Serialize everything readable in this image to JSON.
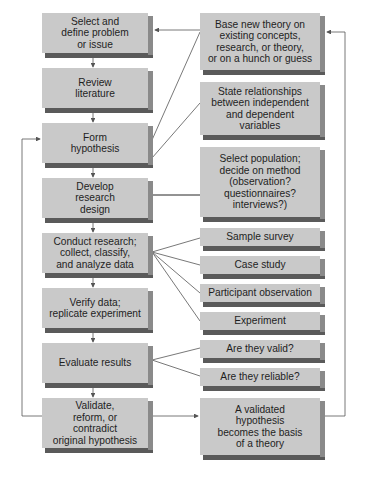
{
  "diagram": {
    "type": "flowchart",
    "colors": {
      "box_face": "#c9c9c9",
      "box_side": "#8a8a8a",
      "box_bottom": "#5a5a5a",
      "line": "#555555",
      "text": "#1e1e1e"
    },
    "left_column": [
      {
        "id": "L1",
        "label": "Select and\ndefine problem\nor issue"
      },
      {
        "id": "L2",
        "label": "Review\nliterature"
      },
      {
        "id": "L3",
        "label": "Form\nhypothesis"
      },
      {
        "id": "L4",
        "label": "Develop\nresearch\ndesign"
      },
      {
        "id": "L5",
        "label": "Conduct research;\ncollect, classify,\nand analyze data"
      },
      {
        "id": "L6",
        "label": "Verify data;\nreplicate experiment"
      },
      {
        "id": "L7",
        "label": "Evaluate results"
      },
      {
        "id": "L8",
        "label": "Validate,\nreform, or\ncontradict\noriginal hypothesis"
      }
    ],
    "right_column": [
      {
        "id": "R1",
        "label": "Base new theory on\nexisting concepts,\nresearch, or theory,\nor on a hunch or guess"
      },
      {
        "id": "R2",
        "label": "State relationships\nbetween independent\nand dependent\nvariables"
      },
      {
        "id": "R3",
        "label": "Select population;\ndecide on method\n(observation?\nquestionnaires?\ninterviews?)"
      },
      {
        "id": "R4",
        "label": "Sample survey"
      },
      {
        "id": "R5",
        "label": "Case study"
      },
      {
        "id": "R6",
        "label": "Participant observation"
      },
      {
        "id": "R7",
        "label": "Experiment"
      },
      {
        "id": "R8",
        "label": "Are they valid?"
      },
      {
        "id": "R9",
        "label": "Are they reliable?"
      },
      {
        "id": "R10",
        "label": "A validated\nhypothesis\nbecomes the basis\nof a theory"
      }
    ],
    "edges": [
      {
        "from": "L1",
        "to": "L2",
        "arrow": true
      },
      {
        "from": "L2",
        "to": "L3",
        "arrow": true
      },
      {
        "from": "L3",
        "to": "L4",
        "arrow": true
      },
      {
        "from": "L4",
        "to": "L5",
        "arrow": true
      },
      {
        "from": "L5",
        "to": "L6",
        "arrow": true
      },
      {
        "from": "L6",
        "to": "L7",
        "arrow": true
      },
      {
        "from": "L7",
        "to": "L8",
        "arrow": true
      },
      {
        "from": "L3",
        "to": "R1",
        "arrow": false
      },
      {
        "from": "L3",
        "to": "R2",
        "arrow": false
      },
      {
        "from": "L4",
        "to": "R3",
        "arrow": false
      },
      {
        "from": "L5",
        "to": "R4",
        "arrow": false
      },
      {
        "from": "L5",
        "to": "R5",
        "arrow": false
      },
      {
        "from": "L5",
        "to": "R6",
        "arrow": false
      },
      {
        "from": "L5",
        "to": "R7",
        "arrow": false
      },
      {
        "from": "L7",
        "to": "R8",
        "arrow": false
      },
      {
        "from": "L7",
        "to": "R9",
        "arrow": false
      },
      {
        "from": "L8",
        "to": "R10",
        "arrow": true
      },
      {
        "from": "L8",
        "to": "L3",
        "arrow": true,
        "route": "left feedback loop"
      },
      {
        "from": "R10",
        "to": "R1",
        "arrow": true,
        "route": "right feedback loop"
      },
      {
        "from": "R1",
        "to": "L1",
        "arrow": true
      }
    ]
  }
}
